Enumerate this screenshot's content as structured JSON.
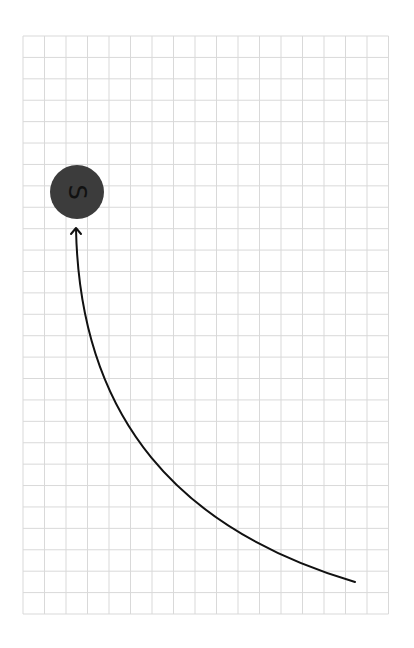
{
  "canvas": {
    "width": 414,
    "height": 648,
    "background": "#ffffff"
  },
  "grid": {
    "left": 23,
    "top": 36,
    "right": 388.5,
    "bottom": 614,
    "cols": 17,
    "rows": 27,
    "line_color": "#d9d9d9"
  },
  "node": {
    "label": "S",
    "cx": 77,
    "cy": 192,
    "r": 27,
    "fill": "#3c3c3c",
    "label_color": "#111111",
    "label_rotation_deg": 90
  },
  "path": {
    "d": "M 355 582 C 180 530, 80 420, 76 229",
    "stroke": "#111111",
    "stroke_width": 2,
    "arrow_tip": {
      "x": 76,
      "y": 228
    }
  }
}
